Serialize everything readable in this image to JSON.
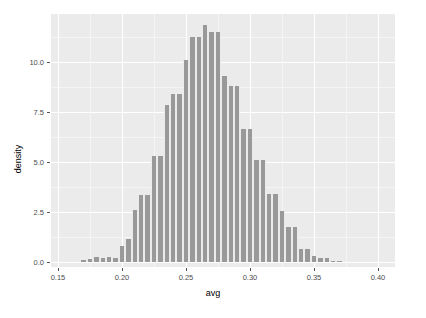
{
  "chart_data": {
    "type": "bar",
    "title": "",
    "subtitle": "",
    "xlabel": "avg",
    "ylabel": "density",
    "xlim": [
      0.1435,
      0.4125
    ],
    "ylim": [
      0.0,
      12.65
    ],
    "grid": true,
    "legend": null,
    "binwidth": 0.005,
    "xticks": [
      "0.15",
      "0.20",
      "0.25",
      "0.30",
      "0.35",
      "0.40"
    ],
    "xtick_values": [
      0.15,
      0.2,
      0.25,
      0.3,
      0.35,
      0.4
    ],
    "yticks": [
      "0.0",
      "2.5",
      "5.0",
      "7.5",
      "10.0"
    ],
    "ytick_values": [
      0.0,
      2.5,
      5.0,
      7.5,
      10.0
    ],
    "bar_color": "#999999",
    "panel_color": "#ebebeb",
    "grid_color": "#ffffff",
    "bins": [
      {
        "x": 0.17,
        "value": 0.1
      },
      {
        "x": 0.175,
        "value": 0.15
      },
      {
        "x": 0.18,
        "value": 0.25
      },
      {
        "x": 0.185,
        "value": 0.2
      },
      {
        "x": 0.19,
        "value": 0.25
      },
      {
        "x": 0.195,
        "value": 0.2
      },
      {
        "x": 0.2,
        "value": 0.8
      },
      {
        "x": 0.205,
        "value": 1.15
      },
      {
        "x": 0.21,
        "value": 2.6
      },
      {
        "x": 0.215,
        "value": 3.35
      },
      {
        "x": 0.22,
        "value": 3.35
      },
      {
        "x": 0.225,
        "value": 5.3
      },
      {
        "x": 0.23,
        "value": 5.3
      },
      {
        "x": 0.235,
        "value": 7.85
      },
      {
        "x": 0.24,
        "value": 8.4
      },
      {
        "x": 0.245,
        "value": 8.4
      },
      {
        "x": 0.25,
        "value": 10.1
      },
      {
        "x": 0.255,
        "value": 11.25
      },
      {
        "x": 0.26,
        "value": 11.25
      },
      {
        "x": 0.265,
        "value": 11.85
      },
      {
        "x": 0.27,
        "value": 11.5
      },
      {
        "x": 0.275,
        "value": 11.5
      },
      {
        "x": 0.28,
        "value": 9.3
      },
      {
        "x": 0.285,
        "value": 8.8
      },
      {
        "x": 0.29,
        "value": 8.8
      },
      {
        "x": 0.295,
        "value": 6.65
      },
      {
        "x": 0.3,
        "value": 6.65
      },
      {
        "x": 0.305,
        "value": 5.1
      },
      {
        "x": 0.31,
        "value": 5.1
      },
      {
        "x": 0.315,
        "value": 3.4
      },
      {
        "x": 0.32,
        "value": 3.4
      },
      {
        "x": 0.325,
        "value": 2.55
      },
      {
        "x": 0.33,
        "value": 1.75
      },
      {
        "x": 0.335,
        "value": 1.75
      },
      {
        "x": 0.34,
        "value": 0.65
      },
      {
        "x": 0.345,
        "value": 0.65
      },
      {
        "x": 0.35,
        "value": 0.3
      },
      {
        "x": 0.355,
        "value": 0.22
      },
      {
        "x": 0.36,
        "value": 0.22
      },
      {
        "x": 0.365,
        "value": 0.05
      },
      {
        "x": 0.37,
        "value": 0.05
      }
    ]
  }
}
